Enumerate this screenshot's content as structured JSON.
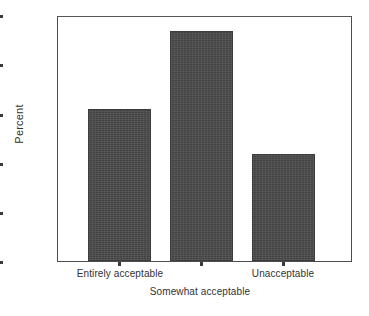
{
  "chart_data": {
    "type": "bar",
    "title": "",
    "subtitle": "",
    "xlabel": "",
    "ylabel": "Percent",
    "categories": [
      "Entirely acceptable",
      "Somewhat acceptable",
      "Unacceptable"
    ],
    "values": [
      30.9,
      46.7,
      21.7
    ],
    "ylim": [
      0,
      50
    ],
    "y_ticks": [
      0,
      10,
      20,
      30,
      40,
      50
    ],
    "y_tick_labels": [
      "0",
      "10",
      "20",
      "30",
      "40",
      "50"
    ],
    "grid": false,
    "legend": null,
    "legend_position": "none",
    "series": [
      {
        "name": "Percent",
        "values": [
          30.9,
          46.7,
          21.7
        ]
      }
    ],
    "annotations": [],
    "bar_color": "#4a4a4a",
    "axis_color": "#4d4d4d",
    "background_color": "#ffffff",
    "category_label_rows": [
      {
        "label": "Entirely acceptable",
        "row": "top"
      },
      {
        "label": "Somewhat acceptable",
        "row": "bottom"
      },
      {
        "label": "Unacceptable",
        "row": "top"
      }
    ]
  },
  "axis": {
    "y_label": "Percent",
    "y_tick_0": "0",
    "y_tick_1": "10",
    "y_tick_2": "20",
    "y_tick_3": "30",
    "y_tick_4": "40",
    "y_tick_5": "50"
  },
  "categories": {
    "cat_0": "Entirely acceptable",
    "cat_1": "Somewhat acceptable",
    "cat_2": "Unacceptable"
  }
}
